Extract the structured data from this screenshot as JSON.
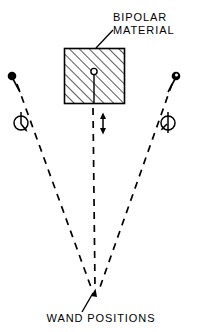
{
  "figure": {
    "title_label": "BIPOLAR MATERIAL",
    "labels": {
      "bipolar_line1": "BIPOLAR",
      "bipolar_line2": "MATERIAL",
      "wand_positions": "WAND POSITIONS"
    },
    "colors": {
      "ink": "#000000",
      "background": "#ffffff",
      "hatch": "#000000"
    },
    "geometry": {
      "block": {
        "x": 64,
        "y": 48,
        "width": 61,
        "height": 56
      },
      "pivot": {
        "cx": 94,
        "cy": 72,
        "r": 3
      },
      "center_axis_x": 94,
      "convergence": {
        "x": 95,
        "y": 290
      },
      "left_wand_dot": {
        "cx": 12,
        "cy": 76,
        "r": 4,
        "fill": "solid"
      },
      "right_wand_dot": {
        "cx": 176,
        "cy": 76,
        "r": 4,
        "fill": "open"
      },
      "double_arrow": {
        "x": 103,
        "y_top": 113,
        "y_bottom": 133
      }
    },
    "annotations": {
      "leader_from_text_to_block": "solid",
      "leader_from_text_to_convergence": "solid-with-arrowhead",
      "wand_paths": "dashed",
      "rotation_symbols": 2
    }
  }
}
